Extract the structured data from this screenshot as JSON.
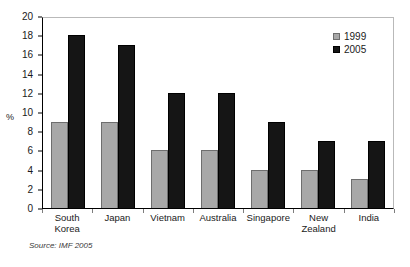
{
  "chart_data": {
    "type": "bar",
    "title": "",
    "subtitle": "",
    "xlabel": "",
    "ylabel": "%",
    "ylim": [
      0,
      20
    ],
    "ytick_step": 2,
    "yticks": [
      20,
      18,
      16,
      14,
      12,
      10,
      8,
      6,
      4,
      2,
      0
    ],
    "grid": false,
    "legend_position": "top-right",
    "categories": [
      "South\nKorea",
      "Japan",
      "Vietnam",
      "Australia",
      "Singapore",
      "New\nZealand",
      "India"
    ],
    "series": [
      {
        "name": "1999",
        "color": "#a8a8a8",
        "values": [
          9,
          9,
          6,
          6,
          4,
          4,
          3
        ]
      },
      {
        "name": "2005",
        "color": "#151515",
        "values": [
          18,
          17,
          12,
          12,
          9,
          7,
          7
        ]
      }
    ],
    "annotations": {
      "source": "Source: IMF 2005"
    }
  }
}
